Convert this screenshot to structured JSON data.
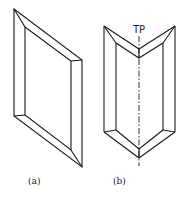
{
  "figure": {
    "panels": [
      {
        "id": "a",
        "label": "(a)",
        "description": "Flat rectangular frame shown in oblique/isometric view"
      },
      {
        "id": "b",
        "label": "(b)",
        "description": "Frame folded along a central vertical axis into a V shape",
        "axis_label": "TP"
      }
    ]
  },
  "colors": {
    "line": "#1a1a1a",
    "background": "#ffffff"
  }
}
